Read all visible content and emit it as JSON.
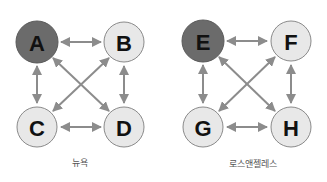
{
  "colors": {
    "highlight_node_fill": "#6b6b6b",
    "normal_node_fill": "#e8e8e8",
    "node_stroke": "#8a8a8a",
    "arrow": "#8c8c8c"
  },
  "graphs": [
    {
      "caption": "뉴욕",
      "nodes": [
        {
          "id": "A",
          "label": "A",
          "highlighted": true
        },
        {
          "id": "B",
          "label": "B",
          "highlighted": false
        },
        {
          "id": "C",
          "label": "C",
          "highlighted": false
        },
        {
          "id": "D",
          "label": "D",
          "highlighted": false
        }
      ],
      "edges": [
        [
          "A",
          "B"
        ],
        [
          "A",
          "C"
        ],
        [
          "A",
          "D"
        ],
        [
          "B",
          "C"
        ],
        [
          "B",
          "D"
        ],
        [
          "C",
          "D"
        ]
      ]
    },
    {
      "caption": "로스앤젤레스",
      "nodes": [
        {
          "id": "E",
          "label": "E",
          "highlighted": true
        },
        {
          "id": "F",
          "label": "F",
          "highlighted": false
        },
        {
          "id": "G",
          "label": "G",
          "highlighted": false
        },
        {
          "id": "H",
          "label": "H",
          "highlighted": false
        }
      ],
      "edges": [
        [
          "E",
          "F"
        ],
        [
          "E",
          "G"
        ],
        [
          "E",
          "H"
        ],
        [
          "F",
          "G"
        ],
        [
          "F",
          "H"
        ],
        [
          "G",
          "H"
        ]
      ]
    }
  ]
}
